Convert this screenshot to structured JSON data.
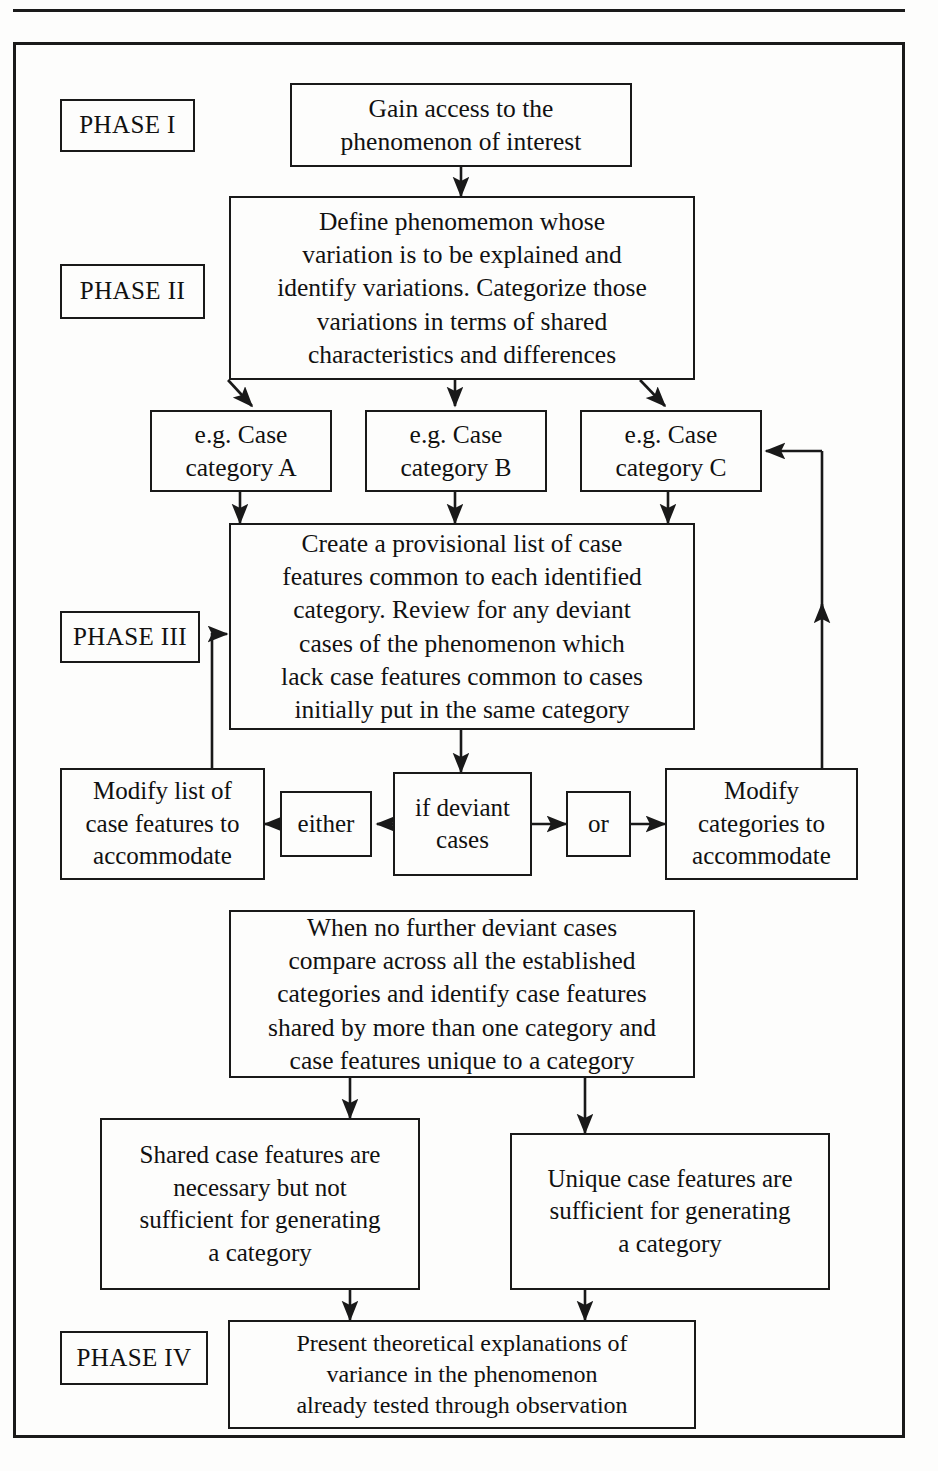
{
  "figure": {
    "type": "flowchart",
    "orientation": "vertical",
    "frame_border_color": "#1a1a1a",
    "background_color": "#fdfdfc"
  },
  "phases": [
    {
      "id": "phase-1",
      "label": "PHASE I"
    },
    {
      "id": "phase-2",
      "label": "PHASE II"
    },
    {
      "id": "phase-3",
      "label": "PHASE III"
    },
    {
      "id": "phase-4",
      "label": "PHASE IV"
    }
  ],
  "nodes": {
    "gain_access": "Gain access to the\nphenomenon of interest",
    "define_phenomenon": "Define phenomemon whose\nvariation is to be explained and\nidentify variations. Categorize those\nvariations in terms of shared\ncharacteristics and differences",
    "case_category_a": "e.g. Case\ncategory A",
    "case_category_b": "e.g. Case\ncategory B",
    "case_category_c": "e.g. Case\ncategory C",
    "provisional_list": "Create a provisional list of case\nfeatures common to each identified\ncategory. Review for any deviant\ncases of the phenomenon which\nlack case features common to cases\ninitially put in the same category",
    "modify_features": "Modify list of\ncase features to\naccommodate",
    "either": "either",
    "if_deviant": "if deviant\ncases",
    "or": "or",
    "modify_categories": "Modify\ncategories to\naccommodate",
    "compare_established": "When no further deviant cases\ncompare across all the established\ncategories and identify case features\nshared by more than one category and\ncase features unique to a category",
    "shared_features": "Shared case features are\nnecessary but not\nsufficient for generating\na category",
    "unique_features": "Unique case features are\nsufficient for generating\na category",
    "present_theory": "Present theoretical explanations of\nvariance in the phenomenon\nalready tested through observation"
  },
  "edges": [
    {
      "from": "gain_access",
      "to": "define_phenomenon",
      "style": "straight-down"
    },
    {
      "from": "define_phenomenon",
      "to": "case_category_a",
      "style": "diagonal-down-left"
    },
    {
      "from": "define_phenomenon",
      "to": "case_category_b",
      "style": "straight-down"
    },
    {
      "from": "define_phenomenon",
      "to": "case_category_c",
      "style": "diagonal-down-right"
    },
    {
      "from": "case_category_a",
      "to": "provisional_list",
      "style": "straight-down"
    },
    {
      "from": "case_category_b",
      "to": "provisional_list",
      "style": "straight-down"
    },
    {
      "from": "case_category_c",
      "to": "provisional_list",
      "style": "straight-down"
    },
    {
      "from": "provisional_list",
      "to": "if_deviant",
      "style": "straight-down"
    },
    {
      "from": "if_deviant",
      "to": "either",
      "style": "left"
    },
    {
      "from": "either",
      "to": "modify_features",
      "style": "left"
    },
    {
      "from": "if_deviant",
      "to": "or",
      "style": "right"
    },
    {
      "from": "or",
      "to": "modify_categories",
      "style": "right"
    },
    {
      "from": "modify_features",
      "to": "provisional_list",
      "style": "feedback-up-left"
    },
    {
      "from": "modify_categories",
      "to": "case_category_c",
      "style": "feedback-up-right"
    },
    {
      "from": "if_deviant",
      "to": "compare_established",
      "style": "implicit-down"
    },
    {
      "from": "compare_established",
      "to": "shared_features",
      "style": "straight-down"
    },
    {
      "from": "compare_established",
      "to": "unique_features",
      "style": "straight-down"
    },
    {
      "from": "shared_features",
      "to": "present_theory",
      "style": "straight-down"
    },
    {
      "from": "unique_features",
      "to": "present_theory",
      "style": "straight-down"
    }
  ]
}
